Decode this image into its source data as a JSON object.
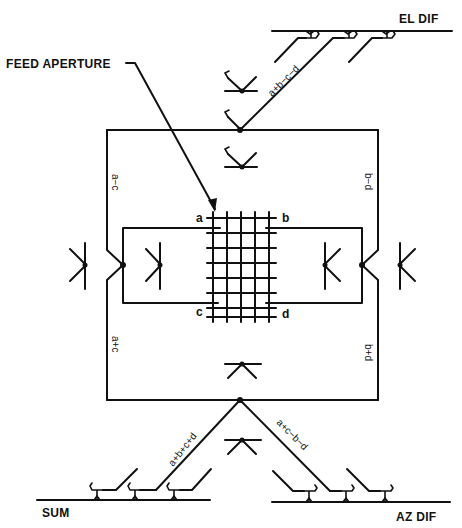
{
  "diagram": {
    "type": "monopulse feed comparator network",
    "labels": {
      "feed_aperture": "FEED APERTURE",
      "el_dif": "EL DIF",
      "sum": "SUM",
      "az_dif": "AZ DIF"
    },
    "ports": {
      "a": "a",
      "b": "b",
      "c": "c",
      "d": "d"
    },
    "signals": {
      "left_upper": "a−c",
      "left_lower": "a+c",
      "right_upper": "b−d",
      "right_lower": "b+d",
      "top_diagonal": "a+b−c−d",
      "bottom_left_diagonal": "a+b+c+d",
      "bottom_right_diagonal": "a+c−b−d"
    },
    "colors": {
      "ink": "#111111",
      "background": "#ffffff"
    }
  }
}
